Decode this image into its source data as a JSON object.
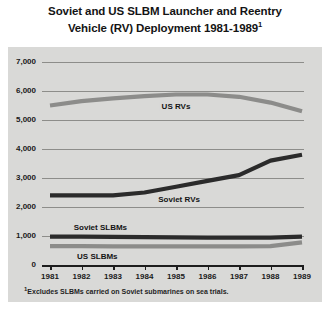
{
  "title": {
    "line1": "Soviet and US SLBM Launcher and Reentry",
    "line2": "Vehicle (RV) Deployment 1981-1989",
    "marker": "1"
  },
  "footnote": {
    "marker": "1",
    "text": "Excludes SLBMs carried on Soviet submarines on sea trials."
  },
  "colors": {
    "background": "#d9d9d7",
    "page": "#ffffff",
    "gridline": "#8d8d8a",
    "axis": "#1d1d1d",
    "us_rvs": "#8c8c8a",
    "soviet_rvs": "#2b2b2b",
    "soviet_slbms": "#2b2b2b",
    "us_slbms": "#8c8c8a",
    "text": "#141414"
  },
  "chart_data": {
    "type": "line",
    "title": "Soviet and US SLBM Launcher and Reentry Vehicle (RV) Deployment 1981-1989",
    "xlabel": "",
    "ylabel": "",
    "x": [
      1981,
      1982,
      1983,
      1984,
      1985,
      1986,
      1987,
      1988,
      1989
    ],
    "xticklabels": [
      "1981",
      "1982",
      "1983",
      "1984",
      "1985",
      "1986",
      "1987",
      "1988",
      "1989"
    ],
    "ylim": [
      0,
      7000
    ],
    "yticks": [
      0,
      1000,
      2000,
      3000,
      4000,
      5000,
      6000,
      7000
    ],
    "yticklabels": [
      "0",
      "1,000",
      "2,000",
      "3,000",
      "4,000",
      "5,000",
      "6,000",
      "7,000"
    ],
    "grid": true,
    "legend": "inline-labels",
    "series": [
      {
        "name": "US RVs",
        "label": "US RVs",
        "color": "#8c8c8a",
        "values": [
          5500,
          5650,
          5750,
          5820,
          5880,
          5880,
          5800,
          5600,
          5300
        ]
      },
      {
        "name": "Soviet RVs",
        "label": "Soviet RVs",
        "color": "#2b2b2b",
        "values": [
          2400,
          2400,
          2400,
          2500,
          2700,
          2900,
          3100,
          3600,
          3800
        ]
      },
      {
        "name": "Soviet SLBMs",
        "label": "Soviet SLBMs",
        "color": "#2b2b2b",
        "values": [
          980,
          975,
          970,
          960,
          950,
          945,
          940,
          940,
          980
        ]
      },
      {
        "name": "US SLBMs",
        "label": "US SLBMs",
        "color": "#8c8c8a",
        "values": [
          650,
          650,
          645,
          645,
          640,
          640,
          640,
          650,
          780
        ]
      }
    ]
  }
}
